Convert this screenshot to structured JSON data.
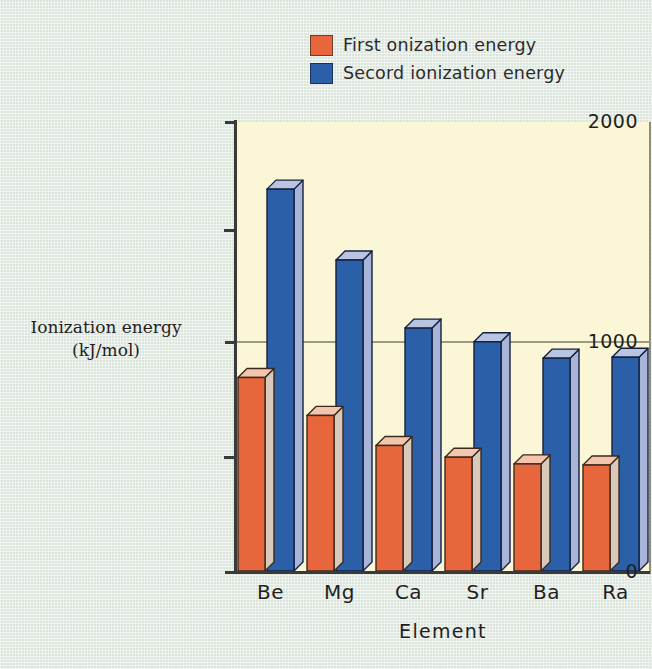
{
  "chart_data": {
    "type": "bar",
    "title": "",
    "xlabel": "Element",
    "ylabel": "Ionization energy (kJ/mol)",
    "categories": [
      "Be",
      "Mg",
      "Ca",
      "Sr",
      "Ba",
      "Ra"
    ],
    "ylim": [
      0,
      2000
    ],
    "ytick_labels": [
      "0",
      "1000",
      "2000"
    ],
    "ytick_values": [
      0,
      1000,
      2000
    ],
    "yminor_tick_values": [
      500,
      1500
    ],
    "grid": "single horizontal gridline at 1000",
    "legend_position": "top-center",
    "series": [
      {
        "name": "First  onization energy",
        "color": "#e8663c",
        "values": [
          862,
          693,
          559,
          507,
          477,
          472
        ]
      },
      {
        "name": "Secord ionization energy",
        "color": "#2b5fa8",
        "values": [
          1701,
          1385,
          1082,
          1021,
          948,
          952
        ]
      }
    ]
  },
  "legend": {
    "items": [
      {
        "label": "First  onization energy",
        "color": "#e8663c"
      },
      {
        "label": "Secord ionization energy",
        "color": "#2b5fa8"
      }
    ]
  },
  "axes": {
    "y_title_line1": "Ionization energy",
    "y_title_line2": "(kJ/mol)",
    "x_title": "Element",
    "y_labels": {
      "top": "2000",
      "mid": "1000",
      "bottom": "0"
    }
  },
  "colors": {
    "background": "#dce5dc",
    "plot_background": "#faf6d6",
    "orange_front": "#e8663c",
    "orange_top": "#f3c5ad",
    "orange_side": "#d9c9bb",
    "blue_front": "#2b5fa8",
    "blue_top": "#b9c4e2",
    "blue_side": "#a8b4d8",
    "gridline": "#9c9c84",
    "axis": "#3a3a3a"
  }
}
